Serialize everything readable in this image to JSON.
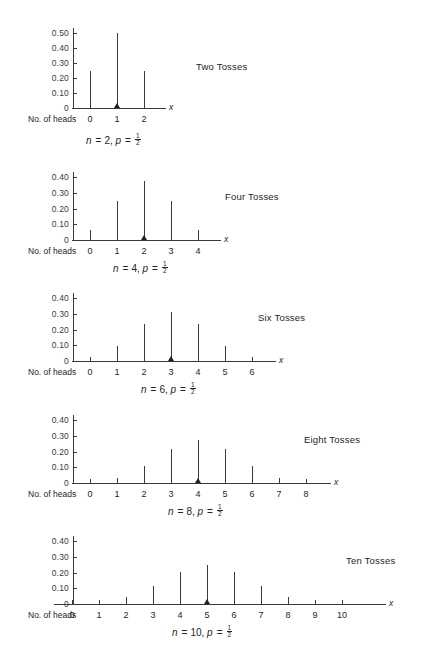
{
  "figure": {
    "axis_label": "No. of heads",
    "x_axis_symbol": "x",
    "y_ticks": [
      "0.50",
      "0.40",
      "0.30",
      "0.20",
      "0.10",
      "0"
    ],
    "y_ticks_short": [
      "0.40",
      "0.30",
      "0.20",
      "0.10",
      "0"
    ]
  },
  "chart_data": [
    {
      "type": "bar",
      "title": "Two Tosses",
      "caption": {
        "n_label": "n",
        "n_value": "2",
        "p_label": "p",
        "p_num": "1",
        "p_den": "2",
        "text": "n = 2, p = 1/2"
      },
      "xlabel": "No. of heads",
      "ylabel": "",
      "x_symbol": "x",
      "categories": [
        "0",
        "1",
        "2"
      ],
      "values": [
        0.25,
        0.5,
        0.25
      ],
      "mean_marker": 1,
      "ylim": [
        0,
        0.52
      ],
      "yticks": [
        0,
        0.1,
        0.2,
        0.3,
        0.4,
        0.5
      ],
      "ytick_labels": [
        "0",
        "0.10",
        "0.20",
        "0.30",
        "0.40",
        "0.50"
      ],
      "grid": false,
      "legend": "none"
    },
    {
      "type": "bar",
      "title": "Four Tosses",
      "caption": {
        "n_label": "n",
        "n_value": "4",
        "p_label": "p",
        "p_num": "1",
        "p_den": "2",
        "text": "n = 4, p = 1/2"
      },
      "xlabel": "No. of heads",
      "ylabel": "",
      "x_symbol": "x",
      "categories": [
        "0",
        "1",
        "2",
        "3",
        "4"
      ],
      "values": [
        0.0625,
        0.25,
        0.375,
        0.25,
        0.0625
      ],
      "mean_marker": 2,
      "ylim": [
        0,
        0.42
      ],
      "yticks": [
        0,
        0.1,
        0.2,
        0.3,
        0.4
      ],
      "ytick_labels": [
        "0",
        "0.10",
        "0.20",
        "0.30",
        "0.40"
      ],
      "grid": false,
      "legend": "none"
    },
    {
      "type": "bar",
      "title": "Six Tosses",
      "caption": {
        "n_label": "n",
        "n_value": "6",
        "p_label": "p",
        "p_num": "1",
        "p_den": "2",
        "text": "n = 6, p = 1/2"
      },
      "xlabel": "No. of heads",
      "ylabel": "",
      "x_symbol": "x",
      "categories": [
        "0",
        "1",
        "2",
        "3",
        "4",
        "5",
        "6"
      ],
      "values": [
        0.0156,
        0.0938,
        0.2344,
        0.3125,
        0.2344,
        0.0938,
        0.0156
      ],
      "mean_marker": 3,
      "ylim": [
        0,
        0.42
      ],
      "yticks": [
        0,
        0.1,
        0.2,
        0.3,
        0.4
      ],
      "ytick_labels": [
        "0",
        "0.10",
        "0.20",
        "0.30",
        "0.40"
      ],
      "grid": false,
      "legend": "none"
    },
    {
      "type": "bar",
      "title": "Eight Tosses",
      "caption": {
        "n_label": "n",
        "n_value": "8",
        "p_label": "p",
        "p_num": "1",
        "p_den": "2",
        "text": "n = 8, p = 1/2"
      },
      "xlabel": "No. of heads",
      "ylabel": "",
      "x_symbol": "x",
      "categories": [
        "0",
        "1",
        "2",
        "3",
        "4",
        "5",
        "6",
        "7",
        "8"
      ],
      "values": [
        0.0039,
        0.0313,
        0.1094,
        0.2188,
        0.2734,
        0.2188,
        0.1094,
        0.0313,
        0.0039
      ],
      "mean_marker": 4,
      "ylim": [
        0,
        0.42
      ],
      "yticks": [
        0,
        0.1,
        0.2,
        0.3,
        0.4
      ],
      "ytick_labels": [
        "0",
        "0.10",
        "0.20",
        "0.30",
        "0.40"
      ],
      "grid": false,
      "legend": "none"
    },
    {
      "type": "bar",
      "title": "Ten Tosses",
      "caption": {
        "n_label": "n",
        "n_value": "10",
        "p_label": "p",
        "p_num": "1",
        "p_den": "2",
        "text": "n = 10, p = 1/2"
      },
      "xlabel": "No. of heads",
      "ylabel": "",
      "x_symbol": "x",
      "categories": [
        "0",
        "1",
        "2",
        "3",
        "4",
        "5",
        "6",
        "7",
        "8",
        "9",
        "10"
      ],
      "values": [
        0.001,
        0.0098,
        0.0439,
        0.1172,
        0.2051,
        0.2461,
        0.2051,
        0.1172,
        0.0439,
        0.0098,
        0.001
      ],
      "mean_marker": 5,
      "ylim": [
        0,
        0.42
      ],
      "yticks": [
        0,
        0.1,
        0.2,
        0.3,
        0.4
      ],
      "ytick_labels": [
        "0",
        "0.10",
        "0.20",
        "0.30",
        "0.40"
      ],
      "grid": false,
      "legend": "none"
    }
  ]
}
